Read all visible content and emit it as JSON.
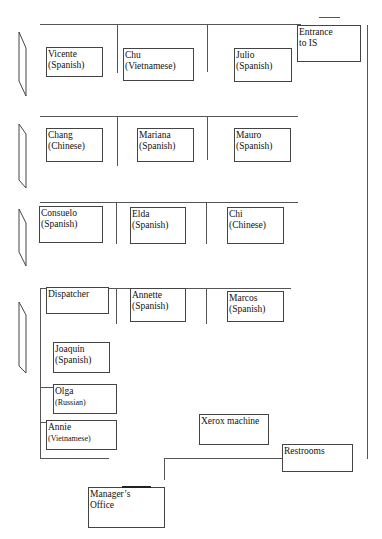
{
  "colors": {
    "line": "#555555",
    "box_border": "#444444",
    "background": "#ffffff",
    "text": "#111111"
  },
  "rows": [
    {
      "row": 1,
      "desks": [
        {
          "name": "Vicente",
          "language": "(Spanish)"
        },
        {
          "name": "Chu",
          "language": "(Vietnamese)"
        },
        {
          "name": "Julio",
          "language": "(Spanish)"
        }
      ]
    },
    {
      "row": 2,
      "desks": [
        {
          "name": "Chang",
          "language": "(Chinese)"
        },
        {
          "name": "Mariana",
          "language": "(Spanish)"
        },
        {
          "name": "Mauro",
          "language": "(Spanish)"
        }
      ]
    },
    {
      "row": 3,
      "desks": [
        {
          "name": "Consuelo",
          "language": "(Spanish)"
        },
        {
          "name": "Elda",
          "language": "(Spanish)"
        },
        {
          "name": "Chi",
          "language": "(Chinese)"
        }
      ]
    },
    {
      "row": 4,
      "desks": [
        {
          "name": "Dispatcher",
          "language": ""
        },
        {
          "name": "Annette",
          "language": "(Spanish)"
        },
        {
          "name": "Marcos",
          "language": "(Spanish)"
        }
      ]
    }
  ],
  "left_column": [
    {
      "name": "Joaquin",
      "language": "(Spanish)"
    },
    {
      "name": "Olga",
      "language": "(Russian)"
    },
    {
      "name": "Annie",
      "language": "(Vietnamese)"
    }
  ],
  "rooms": {
    "entrance": {
      "line1": "Entrance",
      "line2": "to  IS"
    },
    "xerox": {
      "label": "Xerox machine"
    },
    "restrooms": {
      "label": "Restrooms"
    },
    "manager": {
      "line1": "Manager’s",
      "line2": "Office"
    }
  },
  "doors": [
    {
      "id": "door-row-1",
      "icon": "door-icon"
    },
    {
      "id": "door-row-2",
      "icon": "door-icon"
    },
    {
      "id": "door-row-3",
      "icon": "door-icon"
    },
    {
      "id": "door-row-4",
      "icon": "door-icon"
    }
  ]
}
